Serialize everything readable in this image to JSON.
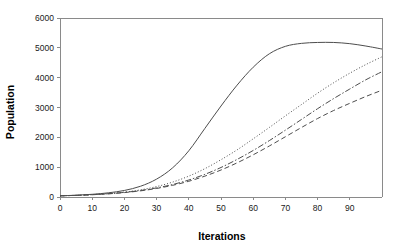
{
  "chart_data": {
    "type": "line",
    "title": "",
    "xlabel": "Iterations",
    "ylabel": "Population",
    "xlim": [
      0,
      100
    ],
    "ylim": [
      0,
      6000
    ],
    "xticks": [
      0,
      10,
      20,
      30,
      40,
      50,
      60,
      70,
      80,
      90
    ],
    "yticks": [
      0,
      1000,
      2000,
      3000,
      4000,
      5000,
      6000
    ],
    "xtick_labels": [
      "0",
      "10",
      "20",
      "30",
      "40",
      "50",
      "60",
      "70",
      "80",
      "90"
    ],
    "ytick_labels": [
      "0",
      "1000",
      "2000",
      "3000",
      "4000",
      "5000",
      "6000"
    ],
    "grid": false,
    "legend": "none",
    "line_color": "#4d4d4d",
    "axis_color": "#8a8a8a",
    "x": [
      0,
      5,
      10,
      15,
      20,
      25,
      30,
      35,
      40,
      45,
      50,
      55,
      60,
      65,
      70,
      75,
      80,
      85,
      90,
      95,
      100
    ],
    "series": [
      {
        "name": "series-1",
        "style": "solid",
        "dasharray": "",
        "values": [
          40,
          60,
          90,
          140,
          220,
          360,
          600,
          980,
          1550,
          2300,
          3050,
          3750,
          4350,
          4800,
          5050,
          5150,
          5180,
          5180,
          5140,
          5060,
          4960
        ]
      },
      {
        "name": "series-2",
        "style": "dotted",
        "dasharray": "1,2",
        "values": [
          40,
          55,
          80,
          115,
          165,
          240,
          350,
          500,
          700,
          950,
          1250,
          1580,
          1950,
          2330,
          2720,
          3100,
          3480,
          3830,
          4150,
          4440,
          4700
        ]
      },
      {
        "name": "series-3",
        "style": "dash-dot",
        "dasharray": "6,2,1.5,2",
        "values": [
          40,
          55,
          78,
          110,
          155,
          218,
          305,
          420,
          570,
          760,
          990,
          1260,
          1560,
          1890,
          2240,
          2600,
          2960,
          3300,
          3620,
          3930,
          4200
        ]
      },
      {
        "name": "series-4",
        "style": "dashed",
        "dasharray": "5,3",
        "values": [
          40,
          55,
          76,
          106,
          148,
          206,
          286,
          392,
          528,
          700,
          905,
          1145,
          1415,
          1710,
          2020,
          2330,
          2630,
          2900,
          3140,
          3370,
          3580
        ]
      }
    ]
  }
}
